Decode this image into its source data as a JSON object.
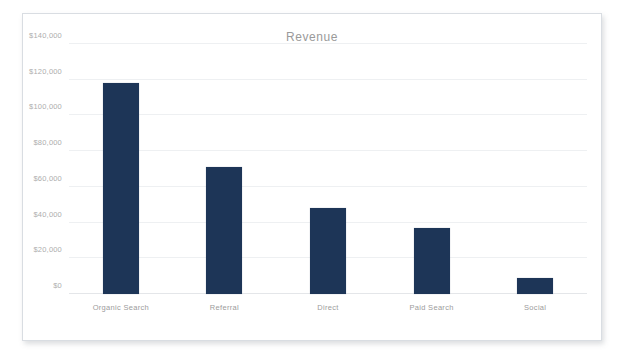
{
  "chart_data": {
    "type": "bar",
    "title": "Revenue",
    "xlabel": "",
    "ylabel": "",
    "categories": [
      "Organic Search",
      "Referral",
      "Direct",
      "Paid Search",
      "Social"
    ],
    "values": [
      118000,
      71000,
      48000,
      37000,
      9000
    ],
    "series": [
      {
        "name": "Revenue",
        "values": [
          118000,
          71000,
          48000,
          37000,
          9000
        ]
      }
    ],
    "ylim": [
      0,
      140000
    ],
    "ytick_values": [
      0,
      20000,
      40000,
      60000,
      80000,
      100000,
      120000,
      140000
    ],
    "ytick_labels": [
      "$0",
      "$20,000",
      "$40,000",
      "$60,000",
      "$80,000",
      "$100,000",
      "$120,000",
      "$140,000"
    ],
    "grid": true,
    "grid_axis": "y",
    "legend": false,
    "legend_position": "none",
    "bar_color": "#1d3557",
    "title_color": "#9a9a9a",
    "tick_label_color": "#adadad",
    "gridline_color": "#eef0f2",
    "panel_background": "#ffffff",
    "panel_border_color": "#d9dde2"
  }
}
